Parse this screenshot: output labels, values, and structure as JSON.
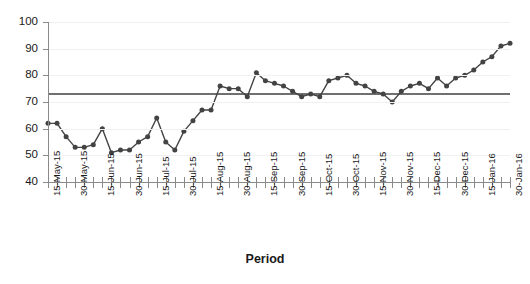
{
  "chart_data": {
    "type": "line",
    "title": "",
    "subtitle": "",
    "xlabel": "Period",
    "ylabel": "",
    "ylim": [
      40,
      100
    ],
    "ytick_step": 10,
    "yticks": [
      40,
      50,
      60,
      70,
      80,
      90,
      100
    ],
    "grid": true,
    "legend": "none",
    "marker": "circle",
    "line_color": "#434343",
    "marker_color": "#434343",
    "reference_line": {
      "label": "",
      "value": 73,
      "color": "#404040"
    },
    "categories": [
      "15-May-15",
      "",
      "",
      "30-May-15",
      "",
      "",
      "15-Jun-15",
      "",
      "",
      "30-Jun-15",
      "",
      "",
      "15-Jul-15",
      "",
      "",
      "30-Jul-15",
      "",
      "",
      "15-Aug-15",
      "",
      "",
      "30-Aug-15",
      "",
      "",
      "15-Sep-15",
      "",
      "",
      "30-Sep-15",
      "",
      "",
      "15-Oct-15",
      "",
      "",
      "30-Oct-15",
      "",
      "",
      "15-Nov-15",
      "",
      "",
      "30-Nov-15",
      "",
      "",
      "15-Dec-15",
      "",
      "",
      "30-Dec-15",
      "",
      "",
      "15-Jan-16",
      "",
      "",
      "30-Jan-16"
    ],
    "xtick_labels": [
      "15-May-15",
      "30-May-15",
      "15-Jun-15",
      "30-Jun-15",
      "15-Jul-15",
      "30-Jul-15",
      "15-Aug-15",
      "30-Aug-15",
      "15-Sep-15",
      "30-Sep-15",
      "15-Oct-15",
      "30-Oct-15",
      "15-Nov-15",
      "30-Nov-15",
      "15-Dec-15",
      "30-Dec-15",
      "15-Jan-16",
      "30-Jan-16"
    ],
    "xtick_label_every": 3,
    "n_ticks": 52,
    "values": [
      62,
      62,
      57,
      53,
      53,
      54,
      60,
      51,
      52,
      52,
      55,
      57,
      64,
      55,
      52,
      59,
      63,
      67,
      67,
      76,
      75,
      75,
      72,
      81,
      78,
      77,
      76,
      74,
      72,
      73,
      72,
      78,
      79,
      80,
      77,
      76,
      74,
      73,
      70,
      74,
      76,
      77,
      75,
      79,
      76,
      79,
      80,
      82,
      85,
      87,
      91,
      92
    ]
  }
}
